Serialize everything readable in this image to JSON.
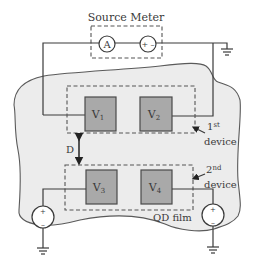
{
  "diagram": {
    "source_meter": {
      "title": "Source Meter",
      "ammeter_label": "A",
      "voltage_source_label": "+ –"
    },
    "pads": [
      {
        "label": "V",
        "sub": "1"
      },
      {
        "label": "V",
        "sub": "2"
      },
      {
        "label": "V",
        "sub": "3"
      },
      {
        "label": "V",
        "sub": "4"
      }
    ],
    "devices": [
      {
        "ordinal": "1",
        "suffix": "st",
        "word": "device"
      },
      {
        "ordinal": "2",
        "suffix": "nd",
        "word": "device"
      }
    ],
    "separation_label": "D",
    "film_label": "QD film",
    "gate_sources": [
      {
        "plus": "+",
        "minus": "–"
      },
      {
        "plus": "+",
        "minus": "–"
      }
    ],
    "colors": {
      "film": "#ececec",
      "pad": "#a9a9a9",
      "line": "#3a3a3a"
    }
  }
}
